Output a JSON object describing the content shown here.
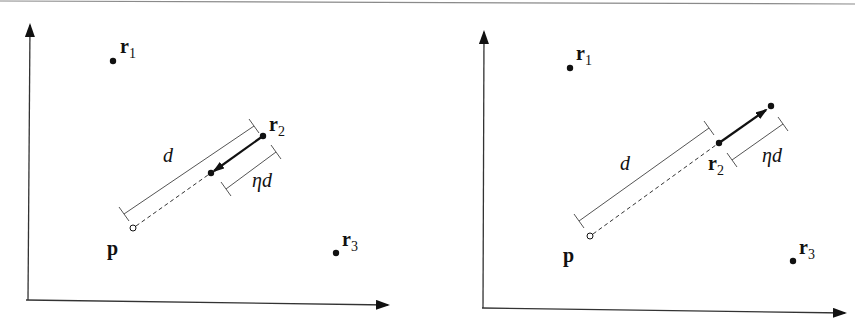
{
  "figure": {
    "top_rule_color": "#8a8a8a",
    "line_color": "#111111",
    "bracket_color": "#555555",
    "panels": [
      {
        "id": "left",
        "description": "Point r2 moved toward p by eta*d",
        "axes": {
          "origin": [
            28,
            300
          ],
          "x_end": [
            388,
            302
          ],
          "y_end": [
            28,
            25
          ]
        },
        "points": {
          "r1": {
            "x": 113,
            "y": 61,
            "label": "r",
            "sub": "1",
            "label_x": 120,
            "label_y": 52
          },
          "r2": {
            "x": 263,
            "y": 136,
            "label": "r",
            "sub": "2",
            "label_x": 270,
            "label_y": 131
          },
          "moved": {
            "x": 211,
            "y": 173
          },
          "p": {
            "x": 133,
            "y": 228,
            "label": "p",
            "label_x": 107,
            "label_y": 255
          },
          "r3": {
            "x": 336,
            "y": 253,
            "label": "r",
            "sub": "3",
            "label_x": 342,
            "label_y": 246
          }
        },
        "d_label": "d",
        "eta_d_label": "ηd",
        "arrow_direction": "toward p"
      },
      {
        "id": "right",
        "description": "Point r2 moved away from p by eta*d",
        "axes": {
          "origin": [
            483,
            308
          ],
          "x_end": [
            845,
            310
          ],
          "y_end": [
            483,
            32
          ]
        },
        "points": {
          "r1": {
            "x": 570,
            "y": 68,
            "label": "r",
            "sub": "1",
            "label_x": 576,
            "label_y": 59
          },
          "r2": {
            "x": 719,
            "y": 143,
            "label": "r",
            "sub": "2",
            "label_x": 708,
            "label_y": 172
          },
          "moved": {
            "x": 771,
            "y": 106
          },
          "p": {
            "x": 590,
            "y": 236,
            "label": "p",
            "label_x": 563,
            "label_y": 262
          },
          "r3": {
            "x": 793,
            "y": 261,
            "label": "r",
            "sub": "3",
            "label_x": 799,
            "label_y": 254
          }
        },
        "d_label": "d",
        "eta_d_label": "ηd",
        "arrow_direction": "away from p"
      }
    ]
  }
}
